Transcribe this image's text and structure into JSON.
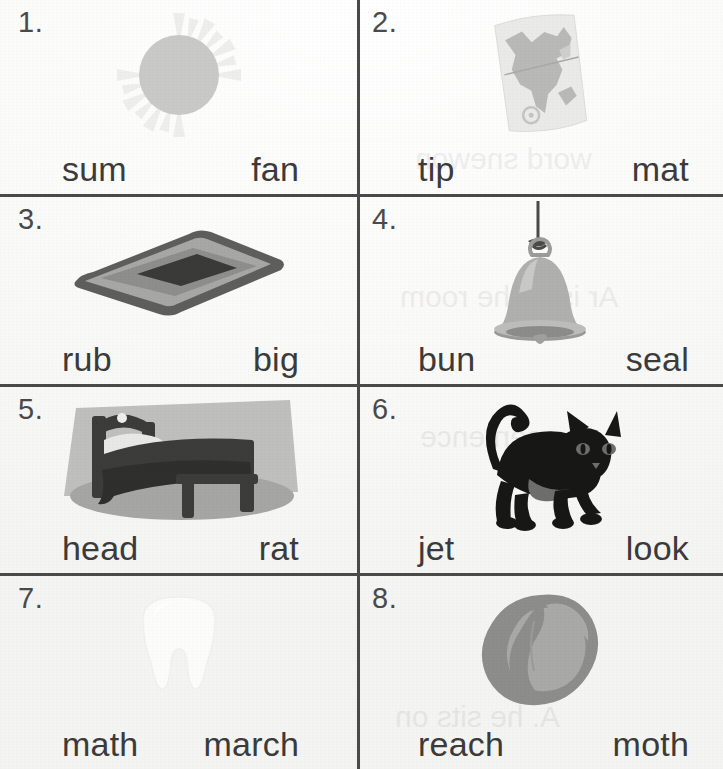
{
  "worksheet": {
    "columns": 2,
    "rows": 4,
    "ink_color": "#3b3b3b",
    "rule_color": "#4a4a4a",
    "paper_color": "#fbfbfa"
  },
  "items": [
    {
      "number": "1.",
      "picture": "sun-illustration",
      "choice_left": "sum",
      "choice_right": "fan"
    },
    {
      "number": "2.",
      "picture": "map-illustration",
      "choice_left": "tip",
      "choice_right": "mat"
    },
    {
      "number": "3.",
      "picture": "rug-illustration",
      "choice_left": "rub",
      "choice_right": "big"
    },
    {
      "number": "4.",
      "picture": "bell-illustration",
      "choice_left": "bun",
      "choice_right": "seal"
    },
    {
      "number": "5.",
      "picture": "bed-illustration",
      "choice_left": "head",
      "choice_right": "rat"
    },
    {
      "number": "6.",
      "picture": "cat-illustration",
      "choice_left": "jet",
      "choice_right": "look"
    },
    {
      "number": "7.",
      "picture": "tooth-illustration",
      "choice_left": "math",
      "choice_right": "march"
    },
    {
      "number": "8.",
      "picture": "peach-illustration",
      "choice_left": "reach",
      "choice_right": "moth"
    }
  ],
  "bleed_through": {
    "line_1": "word snewon",
    "line_2": "Ar is in the room",
    "line_3": "he sentence",
    "line_4": "A. he sits on"
  }
}
